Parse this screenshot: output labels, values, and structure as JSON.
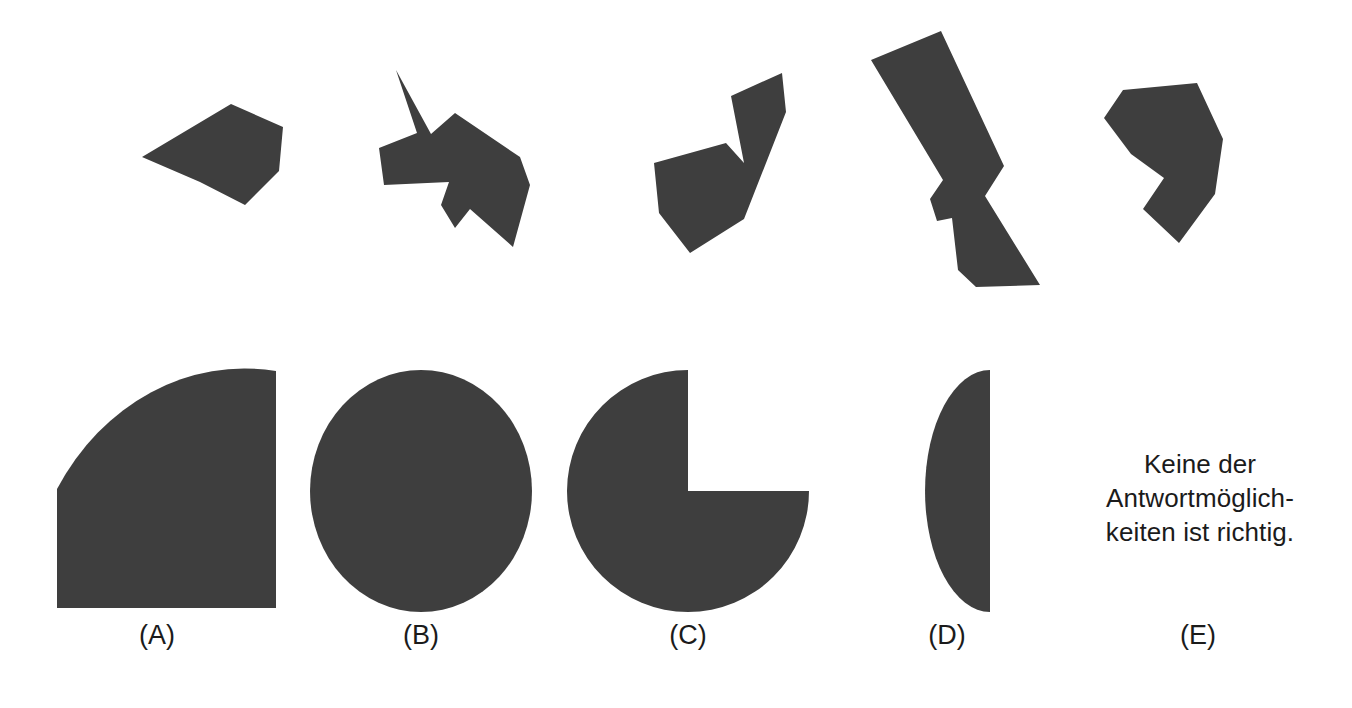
{
  "page": {
    "type": "figure-assembly-item",
    "language": "de",
    "background_color": "#ffffff",
    "shape_fill_color": "#3e3e3e",
    "text_color": "#1b1b1b"
  },
  "pieces": {
    "caption": "",
    "count": 5,
    "items": [
      {
        "id": "piece-1",
        "name": "quadrilateral-wedge",
        "points": "142,157 231,104 283,127 279,171 245,205 200,182"
      },
      {
        "id": "piece-2",
        "name": "spiked-arrow-polygon",
        "points": "396,70 431,134 455,113 520,157 530,185 513,247 470,209 455,228 441,205 449,182 384,185 379,148 417,133"
      },
      {
        "id": "piece-3",
        "name": "v-notched-crescent",
        "points": "782,73 786,112 744,219 690,253 659,213 654,163 726,143 744,163 731,96"
      },
      {
        "id": "piece-4",
        "name": "zigzag-bolt",
        "points": "941,31 871,60 943,180 930,199 937,221 952,218 958,270 976,287 1040,285 985,196 1004,166"
      },
      {
        "id": "piece-5",
        "name": "right-pointing-chevron",
        "points": "1123,90 1197,83 1223,139 1215,194 1179,243 1143,209 1164,178 1131,154 1104,118"
      }
    ]
  },
  "options": {
    "items": [
      {
        "id": "option-a",
        "label": "(A)",
        "shape": "quarter-circle",
        "label_x": 157
      },
      {
        "id": "option-b",
        "label": "(B)",
        "shape": "full-circle",
        "label_x": 421
      },
      {
        "id": "option-c",
        "label": "(C)",
        "shape": "three-quarter-circle",
        "label_x": 688
      },
      {
        "id": "option-d",
        "label": "(D)",
        "shape": "left-half-circle",
        "label_x": 947
      },
      {
        "id": "option-e",
        "label": "(E)",
        "shape": "text",
        "label_x": 1198
      }
    ]
  },
  "answer_e": {
    "line1": "Keine der",
    "line2": "Antwortmöglich-",
    "line3": "keiten ist richtig."
  }
}
